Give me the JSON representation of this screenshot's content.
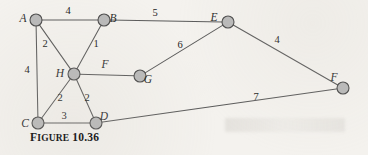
{
  "figure": {
    "caption_lead": "F",
    "caption_rest": "IGURE",
    "caption_number": "10.36",
    "caption_full": "FIGURE 10.36",
    "background_color": "#f4f2ee",
    "node_fill_color": "#b9b9b9",
    "node_stroke_color": "#4a4a4a",
    "edge_color": "#5a5a5a"
  },
  "chart_data": {
    "type": "diagram",
    "nodes": [
      {
        "id": "A",
        "label": "A",
        "x": 36,
        "y": 20,
        "r": 6.0,
        "label_x": 23,
        "label_y": 19
      },
      {
        "id": "B",
        "label": "B",
        "x": 104,
        "y": 20,
        "r": 6.0,
        "label_x": 113,
        "label_y": 19
      },
      {
        "id": "C",
        "label": "C",
        "x": 38,
        "y": 123,
        "r": 6.0,
        "label_x": 25,
        "label_y": 124
      },
      {
        "id": "D",
        "label": "D",
        "x": 96,
        "y": 123,
        "r": 6.0,
        "label_x": 104,
        "label_y": 117
      },
      {
        "id": "E",
        "label": "E",
        "x": 228,
        "y": 22,
        "r": 6.0,
        "label_x": 214,
        "label_y": 18
      },
      {
        "id": "F",
        "label": "F",
        "x": 343,
        "y": 88,
        "r": 6.0,
        "label_x": 334,
        "label_y": 78
      },
      {
        "id": "G",
        "label": "G",
        "x": 140,
        "y": 76,
        "r": 6.0,
        "label_x": 148,
        "label_y": 80
      },
      {
        "id": "H",
        "label": "H",
        "x": 74,
        "y": 74,
        "r": 6.0,
        "label_x": 60,
        "label_y": 74
      }
    ],
    "edges": [
      {
        "from": "A",
        "to": "B",
        "weight": "4",
        "label_x": 68,
        "label_y": 14,
        "italic": false
      },
      {
        "from": "A",
        "to": "H",
        "weight": "2",
        "label_x": 45,
        "label_y": 47,
        "italic": false
      },
      {
        "from": "A",
        "to": "C",
        "weight": "4",
        "label_x": 27,
        "label_y": 73,
        "italic": false
      },
      {
        "from": "B",
        "to": "H",
        "weight": "1",
        "label_x": 96,
        "label_y": 47,
        "italic": false
      },
      {
        "from": "B",
        "to": "E",
        "weight": "5",
        "label_x": 155,
        "label_y": 16,
        "italic": false
      },
      {
        "from": "H",
        "to": "G",
        "weight": "F",
        "label_x": 105,
        "label_y": 68,
        "italic": true
      },
      {
        "from": "H",
        "to": "C",
        "weight": "2",
        "label_x": 60,
        "label_y": 101,
        "italic": false
      },
      {
        "from": "H",
        "to": "D",
        "weight": "2",
        "label_x": 87,
        "label_y": 101,
        "italic": false
      },
      {
        "from": "C",
        "to": "D",
        "weight": "3",
        "label_x": 64,
        "label_y": 119,
        "italic": false
      },
      {
        "from": "G",
        "to": "E",
        "weight": "6",
        "label_x": 180,
        "label_y": 48,
        "italic": false
      },
      {
        "from": "E",
        "to": "F",
        "weight": "4",
        "label_x": 277,
        "label_y": 43,
        "italic": false
      },
      {
        "from": "D",
        "to": "F",
        "weight": "7",
        "label_x": 256,
        "label_y": 100,
        "italic": false
      }
    ],
    "node_count": 8,
    "edge_count": 12,
    "grid": false,
    "legend": null
  }
}
